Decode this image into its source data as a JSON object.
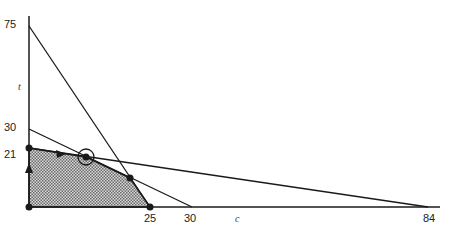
{
  "diagram": {
    "type": "linear-programming-feasible-region",
    "axes": {
      "x_label": "c",
      "y_label": "t",
      "x_ticks": [
        "25",
        "30",
        "84"
      ],
      "y_ticks": [
        "75",
        "30",
        "21"
      ]
    },
    "constraint_lines": [
      {
        "from": "t=75",
        "to": "c=25"
      },
      {
        "from": "t=30",
        "to": "c=30"
      },
      {
        "from": "t=21",
        "to": "c=84"
      }
    ],
    "feasible_region": {
      "fill": "hatched gray",
      "vertices": [
        "(0,0)",
        "(0,21)",
        "optimum",
        "intersection",
        "(25,0)"
      ]
    },
    "path_arrows": [
      "up along t-axis",
      "right along t=21 line"
    ],
    "optimum_marker": "circled vertex",
    "colors": {
      "line": "#1a1a1a",
      "fill": "#9a9a9a",
      "background": "#ffffff"
    }
  }
}
